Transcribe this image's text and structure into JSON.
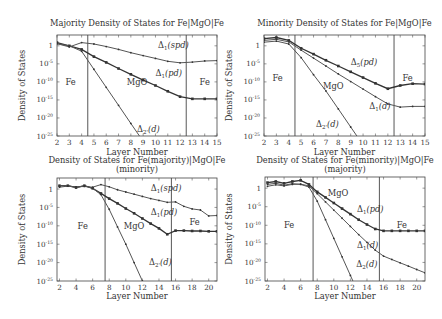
{
  "chart_data": [
    {
      "type": "line",
      "title": [
        "Majority Density of States for Fe|MgO|Fe"
      ],
      "xlabel": "Layer Number",
      "ylabel": "Density of States",
      "xlim": [
        2,
        15
      ],
      "ylim_log10": [
        -25,
        3
      ],
      "yscale": "log",
      "xticks": [
        2,
        3,
        4,
        5,
        6,
        7,
        8,
        9,
        10,
        11,
        12,
        13,
        14,
        15
      ],
      "yticks": [
        {
          "v": 0,
          "label": "1"
        },
        {
          "v": -5,
          "label": "10^-5"
        },
        {
          "v": -10,
          "label": "10^-10"
        },
        {
          "v": -15,
          "label": "10^-15"
        },
        {
          "v": -20,
          "label": "10^-20"
        },
        {
          "v": -25,
          "label": "10^-25"
        }
      ],
      "dividers": [
        4.5,
        12.5
      ],
      "regions": [
        {
          "label": "Fe",
          "x": 3.1,
          "y": -10
        },
        {
          "label": "MgO",
          "x": 8.5,
          "y": -10
        },
        {
          "label": "Fe",
          "x": 14,
          "y": -10
        }
      ],
      "series": [
        {
          "name": "Δ1(spd)",
          "label_main": "Δ",
          "label_sub": "1",
          "label_arg": "(spd)",
          "label_x": 10.2,
          "label_y": 0.3,
          "style": "thin",
          "x": [
            2,
            3,
            4,
            5,
            6,
            7,
            8,
            9,
            10,
            11,
            12,
            13,
            14,
            15
          ],
          "log10_y": [
            0.6,
            -0.3,
            0.9,
            0.5,
            -0.2,
            -1.0,
            -1.9,
            -2.7,
            -3.5,
            -4.3,
            -4.7,
            -4.5,
            -4.2,
            -4.1
          ]
        },
        {
          "name": "Δ1(pd)",
          "label_main": "Δ",
          "label_sub": "1",
          "label_arg": "(pd)",
          "label_x": 10.0,
          "label_y": -7.5,
          "style": "bold",
          "x": [
            2,
            3,
            4,
            5,
            6,
            7,
            8,
            9,
            10,
            11,
            12,
            13,
            14,
            15
          ],
          "log10_y": [
            0.9,
            0.0,
            -1.0,
            -3.0,
            -4.6,
            -6.3,
            -7.9,
            -9.5,
            -11.0,
            -12.6,
            -14.1,
            -14.7,
            -14.7,
            -14.7
          ]
        },
        {
          "name": "Δ2'(d)",
          "label_main": "Δ",
          "label_sub": "2'",
          "label_arg": "(d)",
          "label_x": 8.5,
          "label_y": -23,
          "style": "thin",
          "x": [
            2,
            3,
            4,
            5,
            6,
            7,
            8,
            9
          ],
          "log10_y": [
            0.6,
            0.0,
            -1.5,
            -6.5,
            -11.5,
            -16.5,
            -21.5,
            -26.5
          ]
        }
      ]
    },
    {
      "type": "line",
      "title": [
        "Minority Density of States for Fe|MgO|Fe"
      ],
      "xlabel": "Layer Number",
      "ylabel": "Density of States",
      "xlim": [
        2,
        15
      ],
      "ylim_log10": [
        -25,
        3
      ],
      "yscale": "log",
      "xticks": [
        2,
        3,
        4,
        5,
        6,
        7,
        8,
        9,
        10,
        11,
        12,
        13,
        14,
        15
      ],
      "yticks": [
        {
          "v": 0,
          "label": "1"
        },
        {
          "v": -5,
          "label": "10^-5"
        },
        {
          "v": -10,
          "label": "10^-10"
        },
        {
          "v": -15,
          "label": "10^-15"
        },
        {
          "v": -20,
          "label": "10^-20"
        },
        {
          "v": -25,
          "label": "10^-25"
        }
      ],
      "dividers": [
        4.5,
        12.5
      ],
      "regions": [
        {
          "label": "Fe",
          "x": 3.1,
          "y": -9
        },
        {
          "label": "MgO",
          "x": 7.6,
          "y": -11.2
        },
        {
          "label": "Fe",
          "x": 13.6,
          "y": -8.8
        }
      ],
      "series": [
        {
          "name": "Δ5(pd)",
          "label_main": "Δ",
          "label_sub": "5",
          "label_arg": "(pd)",
          "label_x": 9.0,
          "label_y": -4.5,
          "style": "bold",
          "x": [
            2,
            3,
            4,
            5,
            6,
            7,
            8,
            9,
            10,
            11,
            12,
            13,
            14,
            15
          ],
          "log10_y": [
            2.0,
            2.3,
            1.5,
            -0.7,
            -2.3,
            -4.0,
            -5.6,
            -7.2,
            -8.8,
            -10.4,
            -11.9,
            -11.0,
            -10.5,
            -10.6
          ]
        },
        {
          "name": "Δ1(d)",
          "label_main": "Δ",
          "label_sub": "1",
          "label_arg": "(d)",
          "label_x": 10.5,
          "label_y": -16.7,
          "style": "thin",
          "x": [
            2,
            3,
            4,
            5,
            6,
            7,
            8,
            9,
            10,
            11,
            12,
            13,
            14,
            15
          ],
          "log10_y": [
            1.5,
            1.8,
            1.1,
            -1.2,
            -3.4,
            -5.6,
            -7.8,
            -9.9,
            -12.0,
            -14.1,
            -16.1,
            -17.0,
            -16.8,
            -16.8
          ]
        },
        {
          "name": "Δ2'(d)",
          "label_main": "Δ",
          "label_sub": "2'",
          "label_arg": "(d)",
          "label_x": 6.2,
          "label_y": -21.8,
          "style": "thin",
          "x": [
            2,
            3,
            4,
            5,
            6,
            7,
            8,
            9,
            10
          ],
          "log10_y": [
            1.0,
            1.3,
            0.5,
            -3.3,
            -8.0,
            -12.5,
            -17.5,
            -22.5,
            -27.5
          ]
        }
      ]
    },
    {
      "type": "line",
      "title": [
        "Density of States for Fe(majority)|MgO|Fe",
        "(minority)"
      ],
      "xlabel": "Layer Number",
      "ylabel": "Density of States",
      "xlim": [
        1.7,
        21
      ],
      "ylim_log10": [
        -25,
        3
      ],
      "yscale": "log",
      "xticks": [
        2,
        4,
        6,
        8,
        10,
        12,
        14,
        16,
        18,
        20
      ],
      "yticks": [
        {
          "v": 0,
          "label": "1"
        },
        {
          "v": -5,
          "label": "10^-5"
        },
        {
          "v": -10,
          "label": "10^-10"
        },
        {
          "v": -15,
          "label": "10^-15"
        },
        {
          "v": -20,
          "label": "10^-20"
        },
        {
          "v": -25,
          "label": "10^-25"
        }
      ],
      "dividers": [
        7.5,
        15.5
      ],
      "regions": [
        {
          "label": "Fe",
          "x": 4.8,
          "y": -10
        },
        {
          "label": "MgO",
          "x": 11,
          "y": -10
        },
        {
          "label": "Fe",
          "x": 18.3,
          "y": -9
        }
      ],
      "series": [
        {
          "name": "Δ1(spd)",
          "label_main": "Δ",
          "label_sub": "1",
          "label_arg": "(spd)",
          "label_x": 13.0,
          "label_y": 0.3,
          "style": "thin",
          "x": [
            2,
            3,
            4,
            5,
            6,
            7,
            8,
            9,
            10,
            11,
            12,
            13,
            14,
            15,
            16,
            17,
            18,
            19,
            20,
            21
          ],
          "log10_y": [
            0.5,
            0.8,
            0.6,
            0.7,
            0.5,
            1.2,
            0.6,
            -0.2,
            -0.8,
            -1.4,
            -2.0,
            -2.6,
            -3.1,
            -3.6,
            -3.5,
            -4.7,
            -5.4,
            -5.7,
            -7.3,
            -7.2
          ]
        },
        {
          "name": "Δ1(pd)",
          "label_main": "Δ",
          "label_sub": "1",
          "label_arg": "(pd)",
          "label_x": 13.0,
          "label_y": -6.2,
          "style": "bold",
          "x": [
            2,
            3,
            4,
            5,
            6,
            7,
            8,
            9,
            10,
            11,
            12,
            13,
            14,
            15,
            16,
            17,
            18,
            19,
            20,
            21
          ],
          "log10_y": [
            0.9,
            0.9,
            0.4,
            0.9,
            0.2,
            -1.2,
            -2.6,
            -3.9,
            -5.3,
            -6.6,
            -8.0,
            -9.4,
            -10.7,
            -12.3,
            -11.3,
            -11.3,
            -11.4,
            -11.4,
            -11.5,
            -11.5
          ]
        },
        {
          "name": "Δ2'(d)",
          "label_main": "Δ",
          "label_sub": "2'",
          "label_arg": "(d)",
          "label_x": 12.8,
          "label_y": -19.8,
          "style": "thin",
          "x": [
            2,
            3,
            4,
            5,
            6,
            7,
            8,
            9,
            10,
            11,
            12
          ],
          "log10_y": [
            0.9,
            0.9,
            0.4,
            0.9,
            0.2,
            -1.5,
            -5.5,
            -10.3,
            -15.0,
            -20.0,
            -25.0
          ]
        }
      ]
    },
    {
      "type": "line",
      "title": [
        "Density of States for Fe(minority)|MgO|Fe",
        "(majority)"
      ],
      "xlabel": "Layer Number",
      "ylabel": "Density of States",
      "xlim": [
        1.7,
        21
      ],
      "ylim_log10": [
        -25,
        3
      ],
      "yscale": "log",
      "xticks": [
        2,
        4,
        6,
        8,
        10,
        12,
        14,
        16,
        18,
        20
      ],
      "yticks": [
        {
          "v": 0,
          "label": "1"
        },
        {
          "v": -5,
          "label": "10^-5"
        },
        {
          "v": -10,
          "label": "10^-10"
        },
        {
          "v": -15,
          "label": "10^-15"
        },
        {
          "v": -20,
          "label": "10^-20"
        },
        {
          "v": -25,
          "label": "10^-25"
        }
      ],
      "dividers": [
        7.5,
        15.5
      ],
      "regions": [
        {
          "label": "Fe",
          "x": 4.6,
          "y": -10
        },
        {
          "label": "MgO",
          "x": 10.5,
          "y": -1.3
        },
        {
          "label": "Fe",
          "x": 18.2,
          "y": -10
        }
      ],
      "series": [
        {
          "name": "Δ1(pd)",
          "label_main": "Δ",
          "label_sub": "1",
          "label_arg": "(pd)",
          "label_x": 12.8,
          "label_y": -5.6,
          "style": "bold",
          "x": [
            2,
            3,
            4,
            5,
            6,
            7,
            8,
            9,
            10,
            11,
            12,
            13,
            14,
            15,
            16,
            17,
            18,
            19,
            20,
            21
          ],
          "log10_y": [
            1.5,
            1.8,
            1.3,
            1.8,
            2.1,
            1.0,
            -1.0,
            -2.5,
            -4.0,
            -5.5,
            -7.0,
            -8.5,
            -9.8,
            -11.0,
            -11.5,
            -11.5,
            -11.5,
            -11.5,
            -11.5,
            -11.5
          ]
        },
        {
          "name": "Δ1(d)",
          "label_main": "Δ",
          "label_sub": "1",
          "label_arg": "(d)",
          "label_x": 12.8,
          "label_y": -15.4,
          "style": "thin",
          "x": [
            2,
            3,
            4,
            5,
            6,
            7,
            8,
            9,
            10,
            11,
            12,
            13,
            14,
            15,
            16,
            17,
            18,
            19,
            20,
            21
          ],
          "log10_y": [
            0.5,
            0.9,
            0.6,
            1.0,
            1.1,
            0.6,
            -1.5,
            -3.7,
            -5.9,
            -8.1,
            -10.3,
            -12.5,
            -14.6,
            -16.7,
            -18.3,
            -19.2,
            -20.1,
            -21.0,
            -21.9,
            -22.8
          ]
        },
        {
          "name": "Δ2(d)",
          "label_main": "Δ",
          "label_sub": "2",
          "label_arg": "(d)",
          "label_x": 12.7,
          "label_y": -20.5,
          "style": "thin",
          "x": [
            2,
            3,
            4,
            5,
            6,
            7,
            8,
            9,
            10,
            11,
            12,
            13
          ],
          "log10_y": [
            1.0,
            1.3,
            0.8,
            1.2,
            1.0,
            0.3,
            -3.5,
            -8.5,
            -13.5,
            -18.5,
            -23.5,
            -28.5
          ]
        }
      ]
    }
  ]
}
